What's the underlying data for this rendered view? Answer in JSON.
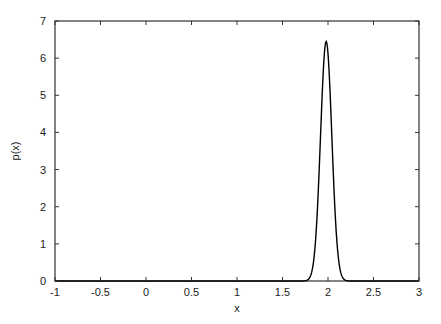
{
  "chart_data": {
    "type": "line",
    "title": "",
    "xlabel": "x",
    "ylabel": "p(x)",
    "xlim": [
      -1,
      3
    ],
    "ylim": [
      0,
      7
    ],
    "xticks": [
      -1,
      -0.5,
      0,
      0.5,
      1,
      1.5,
      2,
      2.5,
      3
    ],
    "xtick_labels": [
      "-1",
      "-0.5",
      "0",
      "0.5",
      "1",
      "1.5",
      "2",
      "2.5",
      "3"
    ],
    "yticks": [
      0,
      1,
      2,
      3,
      4,
      5,
      6,
      7
    ],
    "ytick_labels": [
      "0",
      "1",
      "2",
      "3",
      "4",
      "5",
      "6",
      "7"
    ],
    "grid": false,
    "legend": null,
    "series": [
      {
        "name": "p(x)",
        "description": "Narrow Gaussian-like density peak",
        "peak_x": 1.98,
        "peak_y": 6.45,
        "sigma": 0.062,
        "x": [
          -1,
          1.8,
          1.85,
          1.88,
          1.9,
          1.92,
          1.94,
          1.96,
          1.98,
          2.0,
          2.02,
          2.04,
          2.06,
          2.08,
          2.1,
          2.15,
          3
        ],
        "y": [
          0,
          0.01,
          0.09,
          0.34,
          0.8,
          1.6,
          2.8,
          4.4,
          6.45,
          6.1,
          4.4,
          2.8,
          1.6,
          0.8,
          0.34,
          0.03,
          0
        ]
      }
    ],
    "color": "#000000"
  }
}
